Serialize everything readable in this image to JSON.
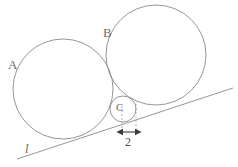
{
  "figure": {
    "canvas": {
      "width": 238,
      "height": 167,
      "background": "#ffffff"
    },
    "stroke_color": "#8a8a8a",
    "dash_color": "#9a9a9a",
    "arrow_color": "#3a3a3a",
    "label_color": "#6b6b6b",
    "circles": [
      {
        "name": "circle-A",
        "label": "A",
        "cx": 63,
        "cy": 89,
        "r": 50,
        "label_x": 8,
        "label_y": 58
      },
      {
        "name": "circle-B",
        "label": "B",
        "cx": 156,
        "cy": 55,
        "r": 50,
        "label_x": 103,
        "label_y": 26
      },
      {
        "name": "circle-C",
        "label": "C",
        "cx": 123,
        "cy": 109,
        "r": 13,
        "label_x": 116,
        "label_y": 102
      }
    ],
    "line": {
      "name": "tangent-line-l",
      "label": "l",
      "x1": 17,
      "y1": 159,
      "x2": 233,
      "y2": 88,
      "label_x": 25,
      "label_y": 142
    },
    "dimension": {
      "name": "dimension-2",
      "label": "2",
      "arrow_y": 132,
      "arrow_x1": 122,
      "arrow_x2": 136,
      "label_x": 125,
      "label_y": 136,
      "guide_left_x": 122,
      "guide_right_x": 136,
      "guide_top_y": 106,
      "guide_bottom_y": 131
    },
    "labels": {
      "A": "A",
      "B": "B",
      "C": "C",
      "l": "l",
      "two": "2"
    }
  }
}
